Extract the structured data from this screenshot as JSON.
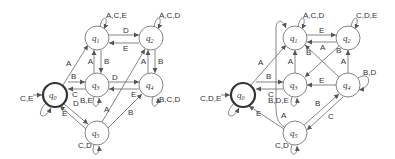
{
  "diagrams": [
    {
      "id": "left",
      "states": [
        {
          "id": "q0",
          "label": "q",
          "sub": "0",
          "x": 55,
          "y": 95,
          "initial": true
        },
        {
          "id": "q1",
          "label": "q",
          "sub": "1",
          "x": 97,
          "y": 38
        },
        {
          "id": "q2",
          "label": "q",
          "sub": "2",
          "x": 151,
          "y": 38
        },
        {
          "id": "q3",
          "label": "q",
          "sub": "3",
          "x": 97,
          "y": 85
        },
        {
          "id": "q4",
          "label": "q",
          "sub": "4",
          "x": 151,
          "y": 85
        },
        {
          "id": "q5",
          "label": "q",
          "sub": "5",
          "x": 97,
          "y": 133
        }
      ],
      "transitions": [
        {
          "from": "q0",
          "to": "q1",
          "label": "A"
        },
        {
          "from": "q0",
          "to": "q3",
          "label": "B"
        },
        {
          "from": "q3",
          "to": "q0",
          "label": "C"
        },
        {
          "from": "q0",
          "to": "q5",
          "label": "D"
        },
        {
          "from": "q5",
          "to": "q0",
          "label": "E"
        },
        {
          "from": "q0",
          "to": "q0",
          "label": "C,E"
        },
        {
          "from": "q1",
          "to": "q1",
          "label": "A,C,E"
        },
        {
          "from": "q1",
          "to": "q2",
          "label": "D"
        },
        {
          "from": "q2",
          "to": "q1",
          "label": "E"
        },
        {
          "from": "q1",
          "to": "q3",
          "label": "B"
        },
        {
          "from": "q3",
          "to": "q1",
          "label": "A"
        },
        {
          "from": "q2",
          "to": "q2",
          "label": "A,C,D"
        },
        {
          "from": "q2",
          "to": "q4",
          "label": "B"
        },
        {
          "from": "q4",
          "to": "q2",
          "label": "A"
        },
        {
          "from": "q3",
          "to": "q4",
          "label": "D"
        },
        {
          "from": "q4",
          "to": "q3",
          "label": "E"
        },
        {
          "from": "q3",
          "to": "q3",
          "label": "B,E"
        },
        {
          "from": "q4",
          "to": "q4",
          "label": "B,C,D"
        },
        {
          "from": "q5",
          "to": "q2",
          "label": "A"
        },
        {
          "from": "q5",
          "to": "q4",
          "label": "B"
        },
        {
          "from": "q5",
          "to": "q5",
          "label": "C,D"
        }
      ]
    },
    {
      "id": "right",
      "states": [
        {
          "id": "q0",
          "label": "q",
          "sub": "0",
          "x": 243,
          "y": 95,
          "initial": true
        },
        {
          "id": "q1",
          "label": "q",
          "sub": "1",
          "x": 295,
          "y": 38
        },
        {
          "id": "q2",
          "label": "q",
          "sub": "2",
          "x": 348,
          "y": 38
        },
        {
          "id": "q3",
          "label": "q",
          "sub": "3",
          "x": 295,
          "y": 85
        },
        {
          "id": "q4",
          "label": "q",
          "sub": "4",
          "x": 348,
          "y": 85
        },
        {
          "id": "q5",
          "label": "q",
          "sub": "5",
          "x": 295,
          "y": 133
        }
      ],
      "transitions": [
        {
          "from": "q0",
          "to": "q1",
          "label": "A"
        },
        {
          "from": "q0",
          "to": "q3",
          "label": "B"
        },
        {
          "from": "q3",
          "to": "q0",
          "label": "C"
        },
        {
          "from": "q5",
          "to": "q0",
          "label": "E"
        },
        {
          "from": "q0",
          "to": "q0",
          "label": "C,D,E"
        },
        {
          "from": "q1",
          "to": "q1",
          "label": "A,C,D"
        },
        {
          "from": "q1",
          "to": "q2",
          "label": "E"
        },
        {
          "from": "q2",
          "to": "q1",
          "label": "A"
        },
        {
          "from": "q3",
          "to": "q1",
          "label": "A"
        },
        {
          "from": "q4",
          "to": "q1",
          "label": "B"
        },
        {
          "from": "q2",
          "to": "q3",
          "label": "B"
        },
        {
          "from": "q2",
          "to": "q2",
          "label": "C,D,E"
        },
        {
          "from": "q4",
          "to": "q2",
          "label": "A"
        },
        {
          "from": "q4",
          "to": "q3",
          "label": "E"
        },
        {
          "from": "q3",
          "to": "q3",
          "label": "B,D,E"
        },
        {
          "from": "q4",
          "to": "q4",
          "label": "B,D"
        },
        {
          "from": "q5",
          "to": "q1",
          "label": "A"
        },
        {
          "from": "q5",
          "to": "q4",
          "label": "B"
        },
        {
          "from": "q4",
          "to": "q5",
          "label": "C"
        },
        {
          "from": "q5",
          "to": "q5",
          "label": "C,D"
        }
      ]
    }
  ],
  "labels": {
    "L": {
      "q0": "q",
      "q0s": "0",
      "q1": "q",
      "q1s": "1",
      "q2": "q",
      "q2s": "2",
      "q3": "q",
      "q3s": "3",
      "q4": "q",
      "q4s": "4",
      "q5": "q",
      "q5s": "5",
      "e01": "A",
      "e03": "B",
      "e30": "C",
      "e05": "D",
      "e50": "E",
      "l0": "C,E",
      "l1": "A,C,E",
      "e12": "D",
      "e21": "E",
      "e13": "B",
      "e31": "A",
      "l2": "A,C,D",
      "e24": "B",
      "e42": "A",
      "e34": "D",
      "e43": "E",
      "l3": "B,E",
      "l4": "B,C,D",
      "e52": "A",
      "e54": "B",
      "l5": "C,D"
    },
    "R": {
      "q0": "q",
      "q0s": "0",
      "q1": "q",
      "q1s": "1",
      "q2": "q",
      "q2s": "2",
      "q3": "q",
      "q3s": "3",
      "q4": "q",
      "q4s": "4",
      "q5": "q",
      "q5s": "5",
      "e01": "A",
      "e03": "B",
      "e30": "C",
      "e50": "E",
      "l0": "C,D,E",
      "l1": "A,C,D",
      "e12": "E",
      "e21": "A",
      "e31": "A",
      "e41": "B",
      "e23": "B",
      "l2": "C,D,E",
      "e42": "A",
      "e43": "E",
      "l3": "B,D,E",
      "l4": "B,D",
      "e51": "A",
      "e54": "B",
      "e45": "C",
      "l5": "C,D"
    }
  }
}
